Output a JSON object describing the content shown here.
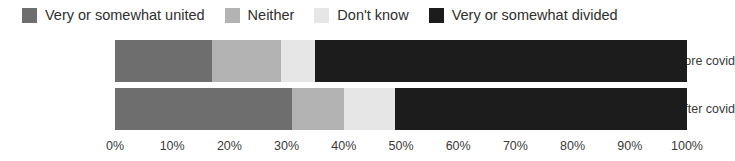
{
  "chart_data": {
    "type": "bar",
    "orientation": "horizontal",
    "stacked": true,
    "stack_mode": "percent",
    "title": "",
    "subtitle": "",
    "xlabel": "",
    "ylabel": "",
    "xlim": [
      0,
      100
    ],
    "grid": false,
    "legend_position": "top",
    "categories": [
      "Before covid",
      "After covid"
    ],
    "tick_labels": [
      "0%",
      "10%",
      "20%",
      "30%",
      "40%",
      "50%",
      "60%",
      "70%",
      "80%",
      "90%",
      "100%"
    ],
    "tick_values": [
      0,
      10,
      20,
      30,
      40,
      50,
      60,
      70,
      80,
      90,
      100
    ],
    "series": [
      {
        "name": "Very or somewhat united",
        "color": "#6e6e6e",
        "values": [
          17,
          31
        ]
      },
      {
        "name": "Neither",
        "color": "#b3b3b3",
        "values": [
          12,
          9
        ]
      },
      {
        "name": "Don't know",
        "color": "#e6e6e6",
        "values": [
          6,
          9
        ]
      },
      {
        "name": "Very or somewhat divided",
        "color": "#1c1c1c",
        "values": [
          65,
          51
        ]
      }
    ]
  },
  "legend": {
    "items": [
      {
        "label": "Very or somewhat united",
        "color": "#6e6e6e"
      },
      {
        "label": "Neither",
        "color": "#b3b3b3"
      },
      {
        "label": "Don't know",
        "color": "#e6e6e6"
      },
      {
        "label": "Very or somewhat divided",
        "color": "#1c1c1c"
      }
    ]
  },
  "axis": {
    "labels": [
      "0%",
      "10%",
      "20%",
      "30%",
      "40%",
      "50%",
      "60%",
      "70%",
      "80%",
      "90%",
      "100%"
    ]
  },
  "categories": {
    "items": [
      "Before covid",
      "After covid"
    ]
  }
}
